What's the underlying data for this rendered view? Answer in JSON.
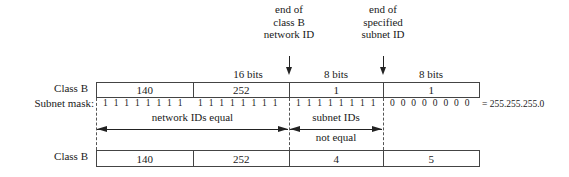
{
  "annotations": {
    "end_network": [
      "end of",
      "class B",
      "network ID"
    ],
    "end_subnet": [
      "end of",
      "specified",
      "subnet ID"
    ]
  },
  "bit_labels": {
    "network": "16 bits",
    "subnet": "8 bits",
    "host": "8 bits"
  },
  "row1": {
    "label": "Class B",
    "cells": [
      "140",
      "252",
      "1",
      "1"
    ]
  },
  "mask": {
    "label": "Subnet mask:",
    "groups": [
      [
        "1",
        "1",
        "1",
        "1",
        "1",
        "1",
        "1",
        "1"
      ],
      [
        "1",
        "1",
        "1",
        "1",
        "1",
        "1",
        "1",
        "1"
      ],
      [
        "1",
        "1",
        "1",
        "1",
        "1",
        "1",
        "1",
        "1"
      ],
      [
        "0",
        "0",
        "0",
        "0",
        "0",
        "0",
        "0",
        "0"
      ]
    ],
    "equals": "= 255.255.255.0"
  },
  "spans": {
    "network_equal": "network IDs equal",
    "subnet_not_equal_1": "subnet IDs",
    "subnet_not_equal_2": "not equal"
  },
  "row2": {
    "label": "Class B",
    "cells": [
      "140",
      "252",
      "4",
      "5"
    ]
  }
}
